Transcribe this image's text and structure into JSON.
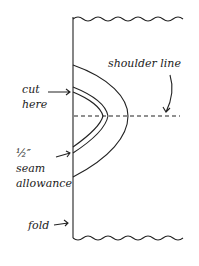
{
  "labels": {
    "cut_here": [
      "cut",
      "here"
    ],
    "seam_allowance": [
      "½″",
      "seam",
      "allowance"
    ],
    "shoulder_line": "shoulder line",
    "fold": "fold"
  },
  "colors": {
    "ink": "#222222",
    "background": "#ffffff"
  }
}
